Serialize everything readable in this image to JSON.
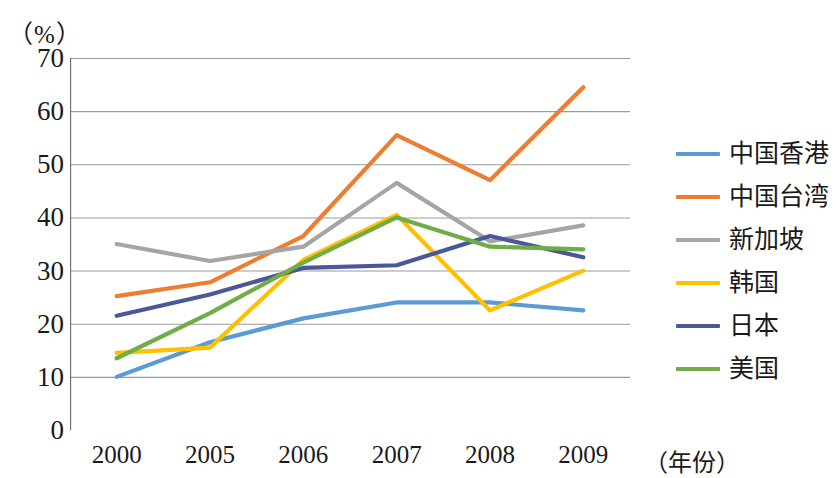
{
  "axis": {
    "unit_label": "（%）",
    "x_caption": "（年份）",
    "y_ticks": [
      "70",
      "60",
      "50",
      "40",
      "30",
      "20",
      "10",
      "0"
    ],
    "x_ticks": [
      "2000",
      "2005",
      "2006",
      "2007",
      "2008",
      "2009"
    ]
  },
  "legend": {
    "items": [
      {
        "label": "中国香港",
        "color": "#5B9BD5"
      },
      {
        "label": "中国台湾",
        "color": "#ED7D31"
      },
      {
        "label": "新加坡",
        "color": "#A5A5A5"
      },
      {
        "label": "韩国",
        "color": "#FFC000"
      },
      {
        "label": "日本",
        "color": "#4A5899"
      },
      {
        "label": "美国",
        "color": "#70AD47"
      }
    ]
  },
  "chart_data": {
    "type": "line",
    "title": "",
    "xlabel": "（年份）",
    "ylabel": "（%）",
    "categories": [
      "2000",
      "2005",
      "2006",
      "2007",
      "2008",
      "2009"
    ],
    "ylim": [
      0,
      70
    ],
    "ytick_step": 10,
    "grid": true,
    "legend_position": "right",
    "series": [
      {
        "name": "中国香港",
        "color": "#5B9BD5",
        "values": [
          10.0,
          16.5,
          21.0,
          24.0,
          24.0,
          22.5
        ]
      },
      {
        "name": "中国台湾",
        "color": "#ED7D31",
        "values": [
          25.2,
          27.8,
          36.5,
          55.5,
          47.0,
          64.5
        ]
      },
      {
        "name": "新加坡",
        "color": "#A5A5A5",
        "values": [
          35.0,
          31.8,
          34.5,
          46.5,
          35.5,
          38.5
        ]
      },
      {
        "name": "韩国",
        "color": "#FFC000",
        "values": [
          14.5,
          15.5,
          32.0,
          40.5,
          22.5,
          30.0
        ]
      },
      {
        "name": "日本",
        "color": "#4A5899",
        "values": [
          21.5,
          25.5,
          30.5,
          31.0,
          36.5,
          32.5
        ]
      },
      {
        "name": "美国",
        "color": "#70AD47",
        "values": [
          13.5,
          22.0,
          31.5,
          40.0,
          34.5,
          34.0
        ]
      }
    ]
  }
}
